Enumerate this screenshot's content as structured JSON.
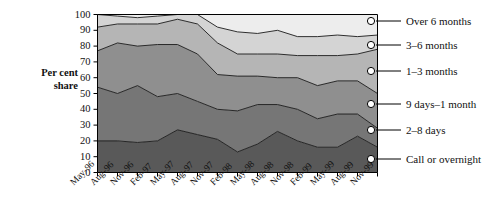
{
  "chart_data": {
    "type": "area",
    "stacked": true,
    "title": "",
    "xlabel": "",
    "ylabel": "Per cent share",
    "ylim": [
      0,
      100
    ],
    "ytick_labels": [
      "0",
      "10",
      "20",
      "30",
      "40",
      "50",
      "60",
      "70",
      "80",
      "90",
      "100"
    ],
    "ytick_values": [
      0,
      10,
      20,
      30,
      40,
      50,
      60,
      70,
      80,
      90,
      100
    ],
    "grid": false,
    "legend_position": "right",
    "categories": [
      "May-96",
      "Aug-96",
      "Nov-96",
      "Feb-97",
      "May-97",
      "Aug-97",
      "Nov-97",
      "Feb-98",
      "May-98",
      "Aug-98",
      "Nov-98",
      "Feb-99",
      "May-99",
      "Aug-99",
      "Nov-99"
    ],
    "series": [
      {
        "name": "Call or overnight",
        "color": "#595959",
        "values": [
          20,
          20,
          19,
          20,
          27,
          24,
          21,
          13,
          18,
          26,
          20,
          16,
          16,
          23,
          16
        ]
      },
      {
        "name": "2–8 days",
        "color": "#767676",
        "values": [
          34,
          30,
          36,
          28,
          23,
          21,
          19,
          26,
          25,
          17,
          20,
          18,
          21,
          14,
          12
        ]
      },
      {
        "name": "9 days–1 month",
        "color": "#8f8f8f",
        "values": [
          23,
          32,
          25,
          33,
          31,
          30,
          22,
          22,
          18,
          17,
          20,
          21,
          21,
          21,
          22
        ]
      },
      {
        "name": "1–3 months",
        "color": "#b5b5b5",
        "values": [
          15,
          12,
          14,
          13,
          16,
          19,
          20,
          14,
          14,
          15,
          14,
          19,
          16,
          17,
          28
        ]
      },
      {
        "name": "3–6 months",
        "color": "#d4d4d4",
        "values": [
          8,
          5,
          4,
          5,
          3,
          6,
          10,
          14,
          13,
          15,
          12,
          12,
          13,
          11,
          9
        ]
      },
      {
        "name": "Over 6 months",
        "color": "#ededed",
        "values": [
          0,
          1,
          2,
          1,
          0,
          0,
          8,
          11,
          12,
          10,
          14,
          14,
          13,
          14,
          13
        ]
      }
    ],
    "cumulative_tops": [
      [
        20,
        20,
        19,
        20,
        27,
        24,
        21,
        13,
        18,
        26,
        20,
        16,
        16,
        23,
        16
      ],
      [
        54,
        50,
        55,
        48,
        50,
        45,
        40,
        39,
        43,
        43,
        40,
        34,
        37,
        37,
        28
      ],
      [
        77,
        82,
        80,
        81,
        81,
        75,
        62,
        61,
        61,
        60,
        60,
        55,
        58,
        58,
        50
      ],
      [
        92,
        94,
        94,
        94,
        97,
        94,
        82,
        75,
        75,
        75,
        74,
        74,
        74,
        75,
        78
      ],
      [
        100,
        99,
        98,
        99,
        100,
        100,
        92,
        89,
        88,
        90,
        86,
        86,
        87,
        86,
        87
      ],
      [
        100,
        100,
        100,
        100,
        100,
        100,
        100,
        100,
        100,
        100,
        100,
        100,
        100,
        100,
        100
      ]
    ]
  },
  "legend": {
    "items": [
      {
        "label": "Over 6 months",
        "marker": "hollow-circle"
      },
      {
        "label": "3–6 months",
        "marker": "hollow-circle"
      },
      {
        "label": "1–3 months",
        "marker": "filled-circle"
      },
      {
        "label": "9 days–1 month",
        "marker": "filled-circle"
      },
      {
        "label": "2–8 days",
        "marker": "filled-circle"
      },
      {
        "label": "Call or overnight",
        "marker": "filled-circle"
      }
    ]
  },
  "axis": {
    "y_title_line1": "Per cent",
    "y_title_line2": "share"
  },
  "colors": {
    "axis_line": "#000000",
    "band_outline": "#1a1a1a",
    "text": "#111111",
    "background": "#ffffff"
  }
}
